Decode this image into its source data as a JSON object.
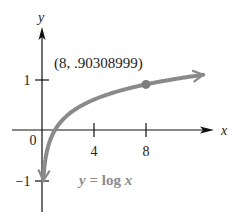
{
  "chart_data": {
    "type": "line",
    "title": "",
    "function_label": "y = log x",
    "xlabel": "x",
    "ylabel": "y",
    "x_ticks": [
      4,
      8
    ],
    "x_tick_labels": [
      "4",
      "8"
    ],
    "y_ticks": [
      1,
      -1
    ],
    "y_tick_labels": [
      "1",
      "−1"
    ],
    "origin_label": "0",
    "xlim": [
      0,
      12
    ],
    "ylim": [
      -1.5,
      1.5
    ],
    "grid": false,
    "series": [
      {
        "name": "y = log x",
        "x": [
          0.1,
          0.2,
          0.5,
          1,
          2,
          3,
          4,
          5,
          6,
          8,
          10,
          11.8
        ],
        "y": [
          -1,
          -0.699,
          -0.301,
          0,
          0.301,
          0.477,
          0.602,
          0.699,
          0.778,
          0.903,
          1,
          1.072
        ]
      }
    ],
    "annotations": [
      {
        "text": "(8, .90308999)",
        "x": 8,
        "y": 0.90308999,
        "marker": true
      }
    ],
    "colors": {
      "curve": "#8a8a8a",
      "axes": "#111111",
      "function_label": "#8c8c8c",
      "text": "#222222"
    }
  }
}
